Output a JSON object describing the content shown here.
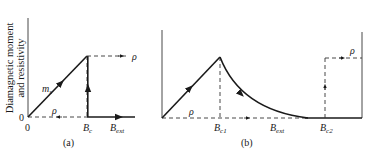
{
  "figure": {
    "ylabel_line1": "Diagnetic moment",
    "ylabel_line1_full": "Diamagnetic moment",
    "ylabel_line2": "and resistivity",
    "panels": [
      {
        "id": "a",
        "caption": "(a)",
        "origin_label": "0",
        "y_origin_label": "0",
        "curves": [
          {
            "name": "m_s",
            "label_main": "m",
            "label_sub": "s",
            "style": "solid"
          },
          {
            "name": "rho_normal",
            "label": "ρ",
            "style": "dashed"
          },
          {
            "name": "rho_super",
            "label": "ρ",
            "style": "dashed"
          }
        ],
        "x_labels": [
          {
            "main": "B",
            "sub": "c"
          },
          {
            "main": "B",
            "sub": "ext"
          }
        ]
      },
      {
        "id": "b",
        "caption": "(b)",
        "curves": [
          {
            "name": "magnetization",
            "style": "solid"
          },
          {
            "name": "rho_normal",
            "label": "ρ",
            "style": "dashed"
          },
          {
            "name": "rho_super",
            "label": "ρ",
            "style": "dashed"
          }
        ],
        "x_labels": [
          {
            "main": "B",
            "sub": "c1"
          },
          {
            "main": "B",
            "sub": "ext"
          },
          {
            "main": "B",
            "sub": "c2"
          }
        ]
      }
    ]
  }
}
